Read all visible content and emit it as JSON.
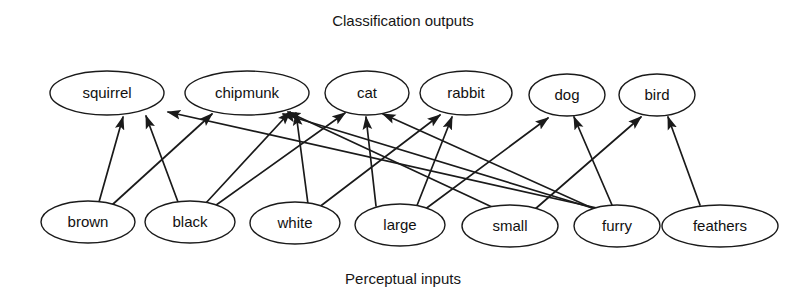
{
  "figure": {
    "top_caption": "Classification outputs",
    "bottom_caption": "Perceptual inputs",
    "background_color": "#ffffff",
    "stroke_color": "#1a1a1a",
    "text_color": "#111111"
  },
  "chart_data": {
    "type": "diagram",
    "title": "Classification outputs",
    "subtitle": "Perceptual inputs",
    "layout": "two-layer directed bipartite graph, arrows point upward from inputs to outputs",
    "layers": [
      {
        "name": "Classification outputs",
        "role": "output",
        "position": "top",
        "nodes": [
          "squirrel",
          "chipmunk",
          "cat",
          "rabbit",
          "dog",
          "bird"
        ]
      },
      {
        "name": "Perceptual inputs",
        "role": "input",
        "position": "bottom",
        "nodes": [
          "brown",
          "black",
          "white",
          "large",
          "small",
          "furry",
          "feathers"
        ]
      }
    ],
    "output_nodes": [
      {
        "id": "squirrel",
        "label": "squirrel",
        "cx": 107,
        "cy": 93,
        "rx": 57,
        "ry": 22
      },
      {
        "id": "chipmunk",
        "label": "chipmunk",
        "cx": 247,
        "cy": 93,
        "rx": 62,
        "ry": 22
      },
      {
        "id": "cat",
        "label": "cat",
        "cx": 367,
        "cy": 93,
        "rx": 42,
        "ry": 22
      },
      {
        "id": "rabbit",
        "label": "rabbit",
        "cx": 466,
        "cy": 93,
        "rx": 46,
        "ry": 22
      },
      {
        "id": "dog",
        "label": "dog",
        "cx": 567,
        "cy": 95,
        "rx": 38,
        "ry": 21
      },
      {
        "id": "bird",
        "label": "bird",
        "cx": 657,
        "cy": 95,
        "rx": 38,
        "ry": 21
      }
    ],
    "input_nodes": [
      {
        "id": "brown",
        "label": "brown",
        "cx": 88,
        "cy": 222,
        "rx": 47,
        "ry": 21
      },
      {
        "id": "black",
        "label": "black",
        "cx": 190,
        "cy": 222,
        "rx": 45,
        "ry": 21
      },
      {
        "id": "white",
        "label": "white",
        "cx": 295,
        "cy": 223,
        "rx": 45,
        "ry": 21
      },
      {
        "id": "large",
        "label": "large",
        "cx": 400,
        "cy": 225,
        "rx": 45,
        "ry": 21
      },
      {
        "id": "small",
        "label": "small",
        "cx": 510,
        "cy": 226,
        "rx": 48,
        "ry": 21
      },
      {
        "id": "furry",
        "label": "furry",
        "cx": 617,
        "cy": 226,
        "rx": 43,
        "ry": 21
      },
      {
        "id": "feathers",
        "label": "feathers",
        "cx": 720,
        "cy": 226,
        "rx": 58,
        "ry": 21
      }
    ],
    "edges": [
      {
        "from": "brown",
        "to": "squirrel",
        "x1": 99,
        "y1": 202,
        "x2": 123,
        "y2": 117
      },
      {
        "from": "brown",
        "to": "chipmunk",
        "x1": 112,
        "y1": 205,
        "x2": 212,
        "y2": 114
      },
      {
        "from": "black",
        "to": "squirrel",
        "x1": 178,
        "y1": 202,
        "x2": 146,
        "y2": 116
      },
      {
        "from": "black",
        "to": "chipmunk",
        "x1": 205,
        "y1": 204,
        "x2": 290,
        "y2": 112
      },
      {
        "from": "black",
        "to": "cat",
        "x1": 212,
        "y1": 208,
        "x2": 345,
        "y2": 113
      },
      {
        "from": "white",
        "to": "chipmunk",
        "x1": 308,
        "y1": 204,
        "x2": 296,
        "y2": 113
      },
      {
        "from": "white",
        "to": "rabbit",
        "x1": 318,
        "y1": 208,
        "x2": 440,
        "y2": 115
      },
      {
        "from": "large",
        "to": "cat",
        "x1": 376,
        "y1": 206,
        "x2": 366,
        "y2": 117
      },
      {
        "from": "large",
        "to": "rabbit",
        "x1": 416,
        "y1": 208,
        "x2": 452,
        "y2": 117
      },
      {
        "from": "large",
        "to": "dog",
        "x1": 424,
        "y1": 210,
        "x2": 548,
        "y2": 118
      },
      {
        "from": "small",
        "to": "chipmunk",
        "x1": 492,
        "y1": 207,
        "x2": 288,
        "y2": 112
      },
      {
        "from": "small",
        "to": "bird",
        "x1": 534,
        "y1": 210,
        "x2": 641,
        "y2": 117
      },
      {
        "from": "furry",
        "to": "squirrel",
        "x1": 597,
        "y1": 208,
        "x2": 168,
        "y2": 112
      },
      {
        "from": "furry",
        "to": "chipmunk",
        "x1": 599,
        "y1": 210,
        "x2": 283,
        "y2": 114
      },
      {
        "from": "furry",
        "to": "cat",
        "x1": 601,
        "y1": 212,
        "x2": 383,
        "y2": 114
      },
      {
        "from": "furry",
        "to": "dog",
        "x1": 612,
        "y1": 205,
        "x2": 574,
        "y2": 117
      },
      {
        "from": "feathers",
        "to": "bird",
        "x1": 700,
        "y1": 205,
        "x2": 668,
        "y2": 117
      }
    ],
    "edge_count": 17,
    "node_count": 13,
    "grid": false,
    "legend": null
  }
}
